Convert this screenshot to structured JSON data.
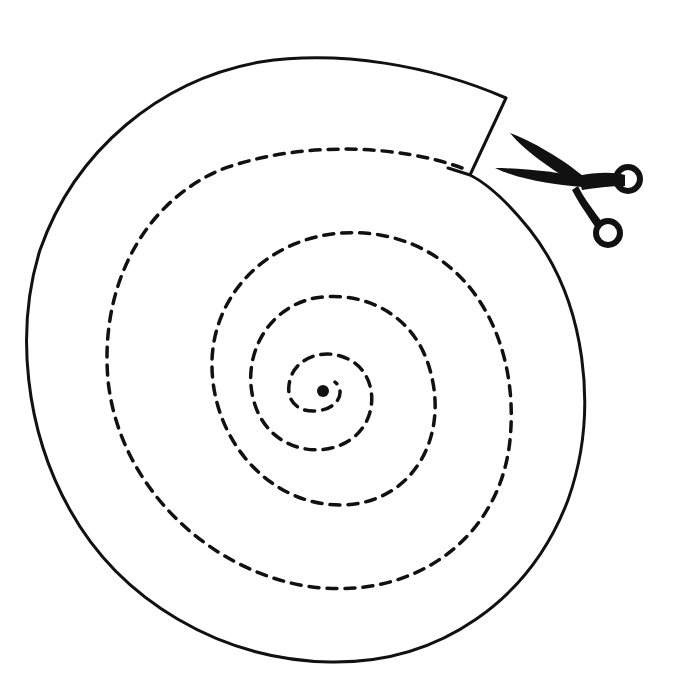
{
  "diagram": {
    "type": "spiral-cutting-template",
    "colors": {
      "line": "#111111",
      "background": "#ffffff"
    },
    "elements": {
      "outer_outline": "solid circular outline with notch at top-right",
      "cut_line": "dashed spiral from outer edge to center",
      "center_dot": "solid center point",
      "scissors": "scissors-icon at notch"
    }
  }
}
